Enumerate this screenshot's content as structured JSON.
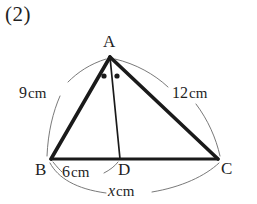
{
  "problem": {
    "number": "(2)"
  },
  "figure": {
    "name": "triangle-abc-with-angle-bisector-ad",
    "vertices": [
      {
        "id": "A",
        "label": "A",
        "x": 110,
        "y": 57
      },
      {
        "id": "B",
        "label": "B",
        "x": 51,
        "y": 159
      },
      {
        "id": "C",
        "label": "C",
        "x": 218,
        "y": 159
      },
      {
        "id": "D",
        "label": "D",
        "x": 120,
        "y": 159
      }
    ],
    "segments": [
      {
        "name": "side-ab",
        "from": "A",
        "to": "B",
        "weight": "thick"
      },
      {
        "name": "side-ac",
        "from": "A",
        "to": "C",
        "weight": "thick"
      },
      {
        "name": "side-bc",
        "from": "B",
        "to": "C",
        "weight": "thick"
      },
      {
        "name": "cevian-ad",
        "from": "A",
        "to": "D",
        "weight": "thin"
      }
    ],
    "angle_marks": [
      {
        "name": "angle-bad-dot",
        "x": 104,
        "y": 76
      },
      {
        "name": "angle-dac-dot",
        "x": 117,
        "y": 76
      }
    ],
    "measures": [
      {
        "name": "measure-ab",
        "value": "9",
        "unit": "cm",
        "text": "9cm",
        "for": "AB"
      },
      {
        "name": "measure-ac",
        "value": "12",
        "unit": "cm",
        "text": "12cm",
        "for": "AC"
      },
      {
        "name": "measure-bd",
        "value": "6",
        "unit": "cm",
        "text": "6cm",
        "for": "BD"
      },
      {
        "name": "measure-bc",
        "value": "x",
        "unit": "cm",
        "text": "xcm",
        "for": "BC",
        "is_variable": true
      }
    ],
    "colors": {
      "stroke": "#1a1a1a",
      "thin_stroke": "#5a5a5a",
      "background": "#ffffff"
    }
  }
}
